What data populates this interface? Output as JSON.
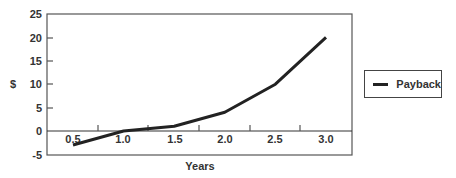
{
  "chart_data": {
    "type": "line",
    "title": "",
    "xlabel": "Years",
    "ylabel": "$",
    "x": [
      0.5,
      1.0,
      1.5,
      2.0,
      2.5,
      3.0
    ],
    "x_tick_labels": [
      "0.5",
      "1.0",
      "1.5",
      "2.0",
      "2.5",
      "3.0"
    ],
    "y_tick_labels": [
      "25",
      "20",
      "15",
      "10",
      "5",
      "0",
      "-5"
    ],
    "ylim": [
      -5,
      25
    ],
    "grid": false,
    "legend_position": "right",
    "series": [
      {
        "name": "Payback",
        "values": [
          -3,
          0,
          1,
          4,
          10,
          20
        ],
        "color": "#222222"
      }
    ]
  },
  "legend": {
    "label": "Payback"
  }
}
